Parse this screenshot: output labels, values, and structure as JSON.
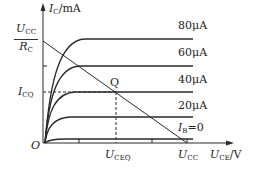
{
  "diagram": {
    "y_axis": {
      "symbol": "I",
      "sub": "C",
      "unit": "/mA"
    },
    "x_axis": {
      "symbol": "U",
      "sub": "CE",
      "unit": "/V"
    },
    "origin": "O",
    "y_intercept": {
      "num_symbol": "U",
      "num_sub": "CC",
      "den_symbol": "R",
      "den_sub": "C"
    },
    "icq": {
      "symbol": "I",
      "sub": "CQ"
    },
    "uceq": {
      "symbol": "U",
      "sub": "CEQ"
    },
    "ucc": {
      "symbol": "U",
      "sub": "CC"
    },
    "q_point": "Q",
    "curves": [
      {
        "label": "80μA",
        "level_y": 39
      },
      {
        "label": "60μA",
        "level_y": 66
      },
      {
        "label": "40μA",
        "level_y": 92
      },
      {
        "label": "20μA",
        "level_y": 117
      },
      {
        "label_symbol": "I",
        "label_sub": "B",
        "label_rest": "=0",
        "level_y": 139
      }
    ],
    "colors": {
      "line": "#2a2a2a"
    }
  }
}
